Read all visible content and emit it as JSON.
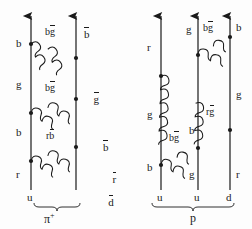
{
  "figure": {
    "type": "feynman-diagram",
    "stroke_color": "#1a1a1a",
    "background_color": "#fdfdfd",
    "width": 252,
    "height": 229
  },
  "diagrams": [
    {
      "id": "pion",
      "hadron_label": "π",
      "hadron_superscript": "+",
      "quark_lines": [
        {
          "id": "pion-quark-left",
          "x": 31,
          "bottom_label": "u",
          "bottom_label_bar": false,
          "segment_labels": [
            {
              "text": "b",
              "bar": false,
              "y": 44
            },
            {
              "text": "g",
              "bar": false,
              "y": 85
            },
            {
              "text": "b",
              "bar": false,
              "y": 133
            },
            {
              "text": "r",
              "bar": false,
              "y": 175
            }
          ]
        },
        {
          "id": "pion-antiquark-right",
          "x": 76,
          "bottom_label": "d",
          "bottom_label_bar": true,
          "segment_labels": [
            {
              "text": "b",
              "bar": true,
              "y": 30
            },
            {
              "text": "g",
              "bar": true,
              "y": 95
            },
            {
              "text": "b",
              "bar": true,
              "y": 143
            },
            {
              "text": "r",
              "bar": true,
              "y": 175
            }
          ]
        }
      ],
      "gluons": [
        {
          "id": "pion-gluon-1",
          "label": "bg",
          "label_text": "bg",
          "label_bar_on": "second",
          "from": [
            31,
            44
          ],
          "to": [
            76,
            58
          ],
          "label_x": 45,
          "label_y": 32
        },
        {
          "id": "pion-gluon-2",
          "label_text": "bg",
          "label_bar_on": "second",
          "from": [
            31,
            113
          ],
          "to": [
            76,
            99
          ],
          "label_x": 45,
          "label_y": 88
        },
        {
          "id": "pion-gluon-3",
          "label_text": "rb",
          "label_bar_on": "second",
          "from": [
            31,
            161
          ],
          "to": [
            76,
            147
          ],
          "label_x": 46,
          "label_y": 136
        }
      ],
      "brace": {
        "x1": 24,
        "x2": 88,
        "y": 206
      },
      "caption_x": 48,
      "caption_y": 212
    },
    {
      "id": "proton",
      "hadron_label": "p",
      "hadron_superscript": "",
      "quark_lines": [
        {
          "id": "proton-quark-1",
          "x": 161,
          "bottom_label": "u",
          "bottom_label_bar": false,
          "segment_labels": [
            {
              "text": "r",
              "bar": false,
              "y": 48
            },
            {
              "text": "g",
              "bar": false,
              "y": 115
            },
            {
              "text": "b",
              "bar": false,
              "y": 168
            }
          ]
        },
        {
          "id": "proton-quark-2",
          "x": 198,
          "bottom_label": "u",
          "bottom_label_bar": false,
          "segment_labels": [
            {
              "text": "g",
              "bar": false,
              "y": 30
            },
            {
              "text": "b",
              "bar": false,
              "y": 131
            },
            {
              "text": "g",
              "bar": false,
              "y": 175
            }
          ]
        },
        {
          "id": "proton-quark-3",
          "x": 230,
          "bottom_label": "d",
          "bottom_label_bar": false,
          "segment_labels": [
            {
              "text": "b",
              "bar": false,
              "y": 28
            },
            {
              "text": "g",
              "bar": false,
              "y": 95
            },
            {
              "text": "r",
              "bar": false,
              "y": 175
            }
          ]
        }
      ],
      "gluons": [
        {
          "id": "proton-gluon-1",
          "label_text": "bg",
          "label_bar_on": "second",
          "from": [
            198,
            55
          ],
          "to": [
            230,
            37
          ],
          "label_x": 202,
          "label_y": 28
        },
        {
          "id": "proton-gluon-2",
          "label_text": "rg",
          "label_bar_on": "second",
          "from": [
            161,
            76
          ],
          "to": [
            230,
            130
          ],
          "label_x": 205,
          "label_y": 112
        },
        {
          "id": "proton-gluon-3",
          "label_text": "bg",
          "label_bar_on": "second",
          "from": [
            161,
            165
          ],
          "to": [
            198,
            148
          ],
          "label_x": 168,
          "label_y": 139
        }
      ],
      "brace": {
        "x1": 152,
        "x2": 240,
        "y": 206
      },
      "caption_x": 193,
      "caption_y": 212
    }
  ],
  "bottom_captions": {
    "pion": "π",
    "pion_sup": "+",
    "proton": "p"
  }
}
